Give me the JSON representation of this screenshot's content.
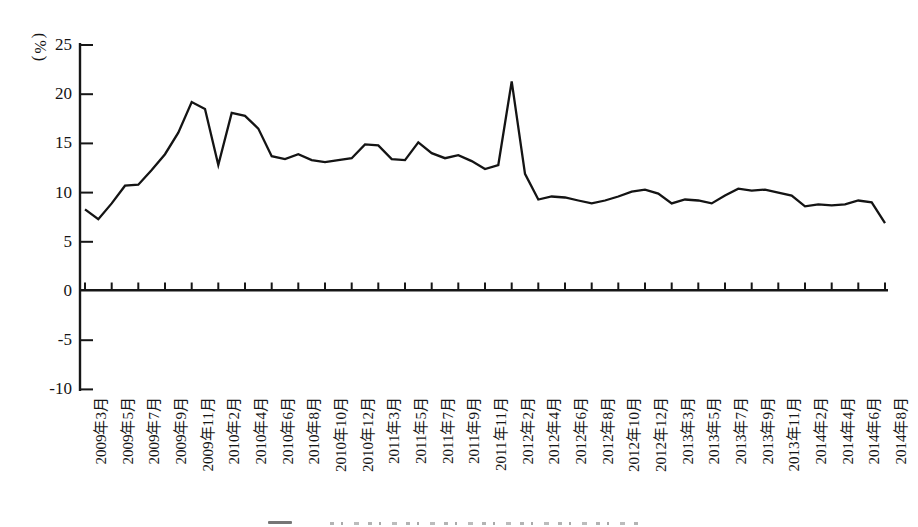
{
  "chart": {
    "background_color": "#ffffff",
    "line_color": "#141414",
    "axis_color": "#161616",
    "text_color": "#141414"
  },
  "chart_data": {
    "type": "line",
    "title": "",
    "xlabel": "",
    "ylabel": "(%)",
    "ylim": [
      -10,
      25
    ],
    "y_ticks": [
      25,
      20,
      15,
      10,
      5,
      0,
      -5,
      -10
    ],
    "grid": false,
    "legend": false,
    "x": [
      "2009年3月",
      "2009年4月",
      "2009年5月",
      "2009年6月",
      "2009年7月",
      "2009年8月",
      "2009年9月",
      "2009年10月",
      "2009年11月",
      "2009年12月",
      "2010年2月",
      "2010年3月",
      "2010年4月",
      "2010年5月",
      "2010年6月",
      "2010年7月",
      "2010年8月",
      "2010年9月",
      "2010年10月",
      "2010年11月",
      "2010年12月",
      "2011年2月",
      "2011年3月",
      "2011年4月",
      "2011年5月",
      "2011年6月",
      "2011年7月",
      "2011年8月",
      "2011年9月",
      "2011年10月",
      "2011年11月",
      "2011年12月",
      "2012年2月",
      "2012年3月",
      "2012年4月",
      "2012年5月",
      "2012年6月",
      "2012年7月",
      "2012年8月",
      "2012年9月",
      "2012年10月",
      "2012年11月",
      "2012年12月",
      "2013年2月",
      "2013年3月",
      "2013年4月",
      "2013年5月",
      "2013年6月",
      "2013年7月",
      "2013年8月",
      "2013年9月",
      "2013年10月",
      "2013年11月",
      "2013年12月",
      "2014年2月",
      "2014年3月",
      "2014年4月",
      "2014年5月",
      "2014年6月",
      "2014年7月",
      "2014年8月"
    ],
    "values": [
      8.3,
      7.3,
      8.9,
      10.7,
      10.8,
      12.3,
      13.9,
      16.1,
      19.2,
      18.5,
      12.8,
      18.1,
      17.8,
      16.5,
      13.7,
      13.4,
      13.9,
      13.3,
      13.1,
      13.3,
      13.5,
      14.9,
      14.8,
      13.4,
      13.3,
      15.1,
      14.0,
      13.5,
      13.8,
      13.2,
      12.4,
      12.8,
      21.3,
      11.9,
      9.3,
      9.6,
      9.5,
      9.2,
      8.9,
      9.2,
      9.6,
      10.1,
      10.3,
      9.9,
      8.9,
      9.3,
      9.2,
      8.9,
      9.7,
      10.4,
      10.2,
      10.3,
      10.0,
      9.7,
      8.6,
      8.8,
      8.7,
      8.8,
      9.2,
      9.0,
      6.9
    ],
    "x_tick_labels": [
      "2009年3月",
      "2009年5月",
      "2009年7月",
      "2009年9月",
      "2009年11月",
      "2010年2月",
      "2010年4月",
      "2010年6月",
      "2010年8月",
      "2010年10月",
      "2010年12月",
      "2011年3月",
      "2011年5月",
      "2011年7月",
      "2011年9月",
      "2011年11月",
      "2012年2月",
      "2012年4月",
      "2012年6月",
      "2012年8月",
      "2012年10月",
      "2012年12月",
      "2013年3月",
      "2013年5月",
      "2013年7月",
      "2013年9月",
      "2013年11月",
      "2014年2月",
      "2014年4月",
      "2014年6月",
      "2014年8月"
    ],
    "x_tick_label_every_n_points": 2
  }
}
